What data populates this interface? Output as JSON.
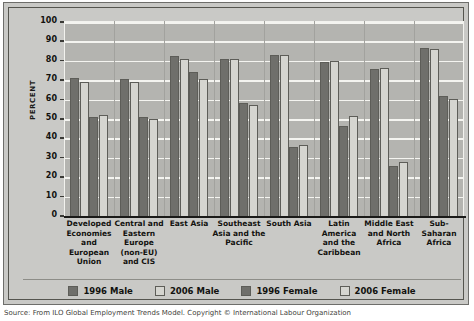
{
  "chart_data": {
    "type": "bar",
    "title": "",
    "xlabel": "",
    "ylabel": "PERCENT",
    "ylim": [
      0,
      100
    ],
    "ytick_step": 10,
    "ytick_labels": [
      "100",
      "90",
      "80",
      "70",
      "60",
      "50",
      "40",
      "30",
      "20",
      "10",
      "0"
    ],
    "grid": true,
    "legend_position": "bottom",
    "categories": [
      "Developed Economies and European Union",
      "Central and Eastern Europe (non-EU) and CIS",
      "East Asia",
      "Southeast Asia and the Pacific",
      "South Asia",
      "Latin America and the Caribbean",
      "Middle East and North Africa",
      "Sub-Saharan Africa"
    ],
    "category_lines": [
      [
        "Developed",
        "Economies",
        "and",
        "European",
        "Union"
      ],
      [
        "Central and",
        "Eastern",
        "Europe",
        "(non-EU)",
        "and CIS"
      ],
      [
        "East Asia"
      ],
      [
        "Southeast",
        "Asia and the",
        "Pacific"
      ],
      [
        "South Asia"
      ],
      [
        "Latin",
        "America",
        "and the",
        "Caribbean"
      ],
      [
        "Middle East",
        "and North",
        "Africa"
      ],
      [
        "Sub-",
        "Saharan",
        "Africa"
      ]
    ],
    "series": [
      {
        "name": "1996 Male",
        "color": "#6f6f6b",
        "values": [
          71,
          70.5,
          82.5,
          81,
          83,
          79.5,
          76,
          86.5
        ]
      },
      {
        "name": "2006 Male",
        "color": "#d5d5d0",
        "values": [
          69,
          69,
          81,
          81,
          83,
          80,
          76.5,
          86
        ]
      },
      {
        "name": "1996 Female",
        "color": "#6f6f6b",
        "values": [
          51,
          51,
          74,
          58,
          35.5,
          46.5,
          26,
          62
        ]
      },
      {
        "name": "2006 Female",
        "color": "#d5d5d0",
        "values": [
          52,
          50,
          70.5,
          57,
          36.5,
          51.5,
          28,
          60.5
        ]
      }
    ]
  },
  "legend": {
    "items": [
      {
        "label": "1996 Male",
        "color": "#6f6f6b"
      },
      {
        "label": "2006 Male",
        "color": "#d5d5d0"
      },
      {
        "label": "1996 Female",
        "color": "#6f6f6b"
      },
      {
        "label": "2006 Female",
        "color": "#d5d5d0"
      }
    ]
  },
  "source": {
    "text": "Source: From ILO Global Employment Trends Model. Copyright © International Labour Organization"
  }
}
